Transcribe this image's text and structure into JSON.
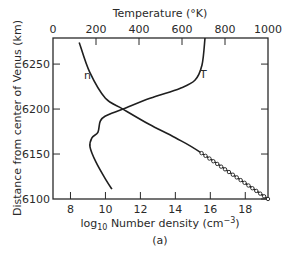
{
  "chart_data": {
    "type": "line",
    "title": "",
    "caption": "(a)",
    "xlabel": "log10 Number density (cm−3)",
    "xlabel_parts": {
      "pre": "log",
      "sub": "10",
      "mid": " Number density (cm",
      "sup": "−3",
      "post": ")"
    },
    "x2label": "Temperature (°K)",
    "ylabel": "Distance from center of Venus (km)",
    "xlim": [
      7,
      19.3
    ],
    "x2lim": [
      0,
      1000
    ],
    "ylim": [
      6100,
      6279
    ],
    "x_ticks": [
      8,
      10,
      12,
      14,
      16,
      18
    ],
    "x2_ticks": [
      0,
      200,
      400,
      600,
      800,
      1000
    ],
    "y_ticks": [
      6100,
      6150,
      6200,
      6250
    ],
    "grid": false,
    "legend": "inline labels",
    "series": [
      {
        "name": "n",
        "label": "n",
        "axis": "bottom",
        "description": "log10 number density",
        "x": [
          8.5,
          9.1,
          10.0,
          11.0,
          12.5,
          14.0,
          15.5,
          19.3
        ],
        "y": [
          6274,
          6241,
          6212,
          6200,
          6183,
          6168,
          6151,
          6100
        ],
        "marker_segment": {
          "from_y": 6151,
          "to_y": 6100,
          "marker": "open-circle"
        }
      },
      {
        "name": "T",
        "label": "T",
        "axis": "top",
        "description": "Temperature (K)",
        "x": [
          707,
          693,
          660,
          590,
          451,
          326,
          242,
          219,
          209,
          181,
          172,
          200,
          247,
          274
        ],
        "y": [
          6279,
          6249,
          6232,
          6223,
          6212,
          6200,
          6192,
          6186,
          6174,
          6168,
          6158,
          6141,
          6121,
          6111
        ]
      }
    ]
  },
  "labels": {
    "x2_title": "Temperature (°K)",
    "y_title": "Distance from center of Venus (km)",
    "caption": "(a)",
    "n_label": "n",
    "t_label": "T"
  }
}
